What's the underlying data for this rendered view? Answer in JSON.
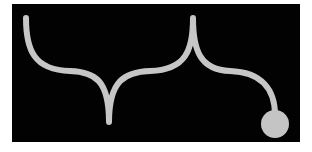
{
  "figure": {
    "background_color": "#020202",
    "stroke_color": "#c6c6c6",
    "circle_color": "#c4c4c4",
    "elements": [
      {
        "type": "path",
        "name": "brace-path"
      },
      {
        "type": "circle",
        "name": "end-dot"
      }
    ]
  }
}
